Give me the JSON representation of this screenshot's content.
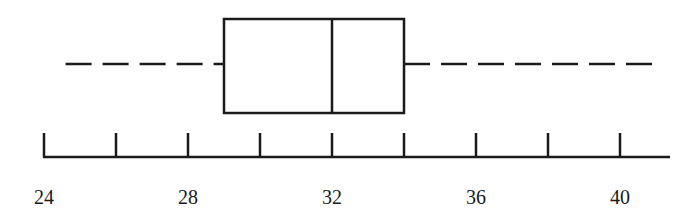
{
  "chart_data": {
    "type": "boxplot",
    "title": "",
    "xlabel": "",
    "ylabel": "",
    "orientation": "horizontal",
    "xlim": [
      24,
      41.5
    ],
    "grid": false,
    "legend": null,
    "axis": {
      "ticks": [
        24,
        26,
        28,
        30,
        32,
        34,
        36,
        38,
        40
      ],
      "tick_labels": [
        "24",
        "28",
        "32",
        "36",
        "40"
      ],
      "labeled_ticks": [
        24,
        28,
        32,
        36,
        40
      ]
    },
    "box": {
      "min": 24.6,
      "q1": 29,
      "median": 32,
      "q3": 34,
      "max": 41
    },
    "whisker_style": "dashed",
    "colors": {
      "stroke": "#1a1a1a",
      "background": "#ffffff"
    }
  }
}
